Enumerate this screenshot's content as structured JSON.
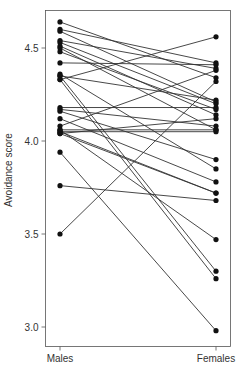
{
  "chart_data": {
    "type": "line",
    "subtype": "paired-slope",
    "title": "",
    "xlabel": "",
    "ylabel": "Avoidance score",
    "categories": [
      "Males",
      "Females"
    ],
    "ylim": [
      2.95,
      4.68
    ],
    "yticks": [
      3.0,
      3.5,
      4.0,
      4.5
    ],
    "ytick_labels": [
      "3.0",
      "3.5",
      "4.0",
      "4.5"
    ],
    "grid": false,
    "legend": "none",
    "pairs": [
      {
        "males": 4.64,
        "females": 4.34
      },
      {
        "males": 4.6,
        "females": 4.42
      },
      {
        "males": 4.59,
        "females": 4.21
      },
      {
        "males": 4.54,
        "females": 4.39
      },
      {
        "males": 4.53,
        "females": 4.2
      },
      {
        "males": 4.51,
        "females": 4.14
      },
      {
        "males": 4.5,
        "females": 4.06
      },
      {
        "males": 4.48,
        "females": 4.17
      },
      {
        "males": 4.42,
        "females": 4.41
      },
      {
        "males": 4.36,
        "females": 3.85
      },
      {
        "males": 4.35,
        "females": 3.3
      },
      {
        "males": 4.33,
        "females": 3.26
      },
      {
        "males": 4.35,
        "females": 4.22
      },
      {
        "males": 4.33,
        "females": 4.56
      },
      {
        "males": 4.18,
        "females": 4.18
      },
      {
        "males": 4.16,
        "females": 3.9
      },
      {
        "males": 4.17,
        "females": 4.08
      },
      {
        "males": 4.12,
        "females": 3.78
      },
      {
        "males": 4.08,
        "females": 4.38
      },
      {
        "males": 4.06,
        "females": 4.06
      },
      {
        "males": 4.05,
        "females": 4.05
      },
      {
        "males": 4.04,
        "females": 4.12
      },
      {
        "males": 4.04,
        "females": 3.72
      },
      {
        "males": 4.05,
        "females": 3.72
      },
      {
        "males": 4.06,
        "females": 3.47
      },
      {
        "males": 3.94,
        "females": 2.98
      },
      {
        "males": 3.76,
        "females": 3.68
      },
      {
        "males": 3.5,
        "females": 4.32
      }
    ],
    "colors": {
      "line": "#333333",
      "dot": "#111111",
      "axis": "#555555"
    }
  }
}
